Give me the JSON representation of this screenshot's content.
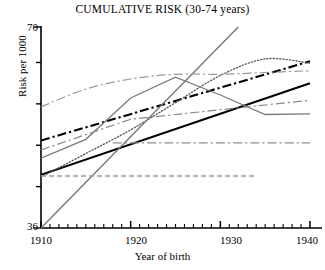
{
  "chart_data": {
    "type": "line",
    "title": "CUMULATIVE RISK (30-74 years)",
    "xlabel": "Year of birth",
    "ylabel": "Risk per 1000",
    "xlim": [
      1910,
      1940
    ],
    "ylim": [
      36,
      70
    ],
    "xticks": [
      1910,
      1920,
      1930,
      1940
    ],
    "xtick_labels": [
      "1910",
      "1920",
      "1930",
      "1940"
    ],
    "xminor_step": 1,
    "yticks": [
      36,
      43,
      50,
      57,
      64,
      70
    ],
    "ytick_labels": [
      "36",
      "",
      "",
      "",
      "",
      "70"
    ],
    "ytick_labels_shown": [
      "36",
      "70"
    ],
    "grid": false,
    "legend": "none",
    "x": [
      1910,
      1915,
      1920,
      1925,
      1930,
      1935,
      1940
    ],
    "series": [
      {
        "name": "bold-solid-black",
        "style": "solid",
        "color": "#000000",
        "width": 2.1,
        "x": [
          1910,
          1940
        ],
        "values": [
          45.0,
          60.5
        ]
      },
      {
        "name": "bold-dashdot-black",
        "style": "dashdot",
        "color": "#000000",
        "width": 2.1,
        "x": [
          1910,
          1940
        ],
        "values": [
          50.8,
          64.2
        ]
      },
      {
        "name": "dotted-gray-arc",
        "style": "dotted",
        "color": "#555555",
        "width": 1.3,
        "x": [
          1910,
          1915,
          1920,
          1925,
          1930,
          1935,
          1940
        ],
        "values": [
          44.6,
          48.6,
          52.6,
          57.2,
          61.8,
          64.6,
          63.9
        ]
      },
      {
        "name": "steep-gray-solid",
        "style": "solid",
        "color": "#777777",
        "width": 1.4,
        "x": [
          1910,
          1932
        ],
        "values": [
          36.0,
          70.0
        ]
      },
      {
        "name": "gray-zigzag-solid",
        "style": "solid",
        "color": "#7a7a7a",
        "width": 1.3,
        "x": [
          1910,
          1915,
          1920,
          1925,
          1930,
          1935,
          1940
        ],
        "values": [
          47.8,
          51.0,
          58.0,
          61.5,
          58.5,
          55.2,
          55.3
        ]
      },
      {
        "name": "light-gray-dashdot-curve",
        "style": "dashdot",
        "color": "#9a9a9a",
        "width": 1.2,
        "x": [
          1910,
          1915,
          1920,
          1925,
          1930,
          1935,
          1940
        ],
        "values": [
          56.5,
          59.5,
          61.2,
          62.0,
          62.0,
          62.3,
          62.6
        ]
      },
      {
        "name": "gray-dashdot-rising",
        "style": "dashdot",
        "color": "#8a8a8a",
        "width": 1.2,
        "x": [
          1910,
          1920,
          1930,
          1940
        ],
        "values": [
          49.2,
          54.4,
          56.0,
          57.6
        ]
      },
      {
        "name": "flat-dashdot-reference",
        "style": "dashdot",
        "color": "#8e8e8e",
        "width": 1.2,
        "x": [
          1918,
          1940
        ],
        "values": [
          50.4,
          50.4
        ]
      },
      {
        "name": "flat-dashed-reference",
        "style": "dashed",
        "color": "#9e9e9e",
        "width": 1.3,
        "x": [
          1910,
          1934
        ],
        "values": [
          44.8,
          44.8
        ]
      }
    ]
  },
  "axes": {
    "y_top_label": "70",
    "y_bottom_label": "36",
    "y_axis_title": "Risk per 1000",
    "x_axis_title": "Year of birth",
    "x_tick_labels": [
      "1910",
      "1920",
      "1930",
      "1940"
    ]
  },
  "title": "CUMULATIVE RISK (30-74 years)"
}
